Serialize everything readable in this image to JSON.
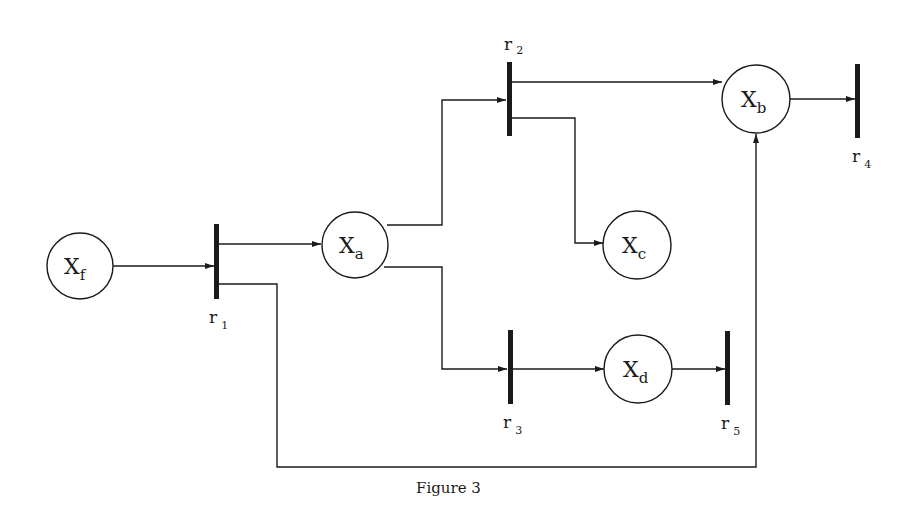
{
  "figure": {
    "caption": "Figure 3",
    "type": "petri-net-reaction-graph"
  },
  "places": [
    {
      "id": "xf",
      "main": "X",
      "sub": "f",
      "cx": 80,
      "cy": 266
    },
    {
      "id": "xa",
      "main": "X",
      "sub": "a",
      "cx": 355,
      "cy": 245
    },
    {
      "id": "xb",
      "main": "X",
      "sub": "b",
      "cx": 756,
      "cy": 99
    },
    {
      "id": "xc",
      "main": "X",
      "sub": "c",
      "cx": 636,
      "cy": 245
    },
    {
      "id": "xd",
      "main": "X",
      "sub": "d",
      "cx": 638,
      "cy": 369
    }
  ],
  "transitions": [
    {
      "id": "r1",
      "main": "r",
      "sub": "1"
    },
    {
      "id": "r2",
      "main": "r",
      "sub": "2"
    },
    {
      "id": "r3",
      "main": "r",
      "sub": "3"
    },
    {
      "id": "r4",
      "main": "r",
      "sub": "4"
    },
    {
      "id": "r5",
      "main": "r",
      "sub": "5"
    }
  ],
  "arcs": [
    {
      "from": "X_f",
      "to": "r_1"
    },
    {
      "from": "r_1",
      "to": "X_a"
    },
    {
      "from": "r_1",
      "to": "X_b"
    },
    {
      "from": "X_a",
      "to": "r_2"
    },
    {
      "from": "X_a",
      "to": "r_3"
    },
    {
      "from": "r_2",
      "to": "X_b"
    },
    {
      "from": "r_2",
      "to": "X_c"
    },
    {
      "from": "X_b",
      "to": "r_4"
    },
    {
      "from": "r_3",
      "to": "X_d"
    },
    {
      "from": "X_d",
      "to": "r_5"
    }
  ],
  "colors": {
    "ink": "#1a1a1a",
    "background": "#ffffff"
  }
}
